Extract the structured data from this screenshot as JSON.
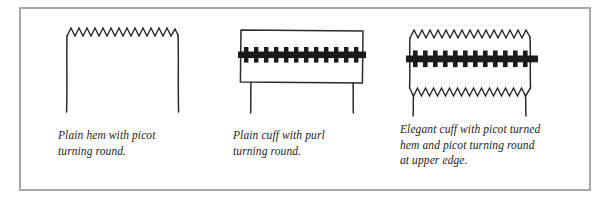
{
  "plate": {
    "border_color": "#a8a8a8",
    "background": "#ffffff",
    "ink_color": "#232323",
    "purl_color": "#1a1a1a"
  },
  "figures": [
    {
      "name": "plain-hem-with-picot",
      "caption": "Plain hem with picot\nturning round.",
      "features": {
        "top_edge": "picot-zigzag",
        "zigzag_peaks": 14,
        "side_legs": 2,
        "purl_band": false,
        "bottom_edge": "open"
      }
    },
    {
      "name": "plain-cuff-with-purl",
      "caption": "Plain cuff with purl\nturning round.",
      "features": {
        "top_edge": "straight",
        "zigzag_peaks": 0,
        "side_legs": 2,
        "purl_band": true,
        "purl_rungs": 13,
        "bottom_edge": "straight"
      }
    },
    {
      "name": "elegant-cuff-with-picot",
      "caption": "Elegant cuff with picot turned\nhem and picot turning round\nat upper edge.",
      "features": {
        "top_edge": "picot-zigzag",
        "zigzag_peaks": 13,
        "side_legs": 2,
        "purl_band": true,
        "purl_rungs": 13,
        "bottom_edge": "picot-zigzag"
      }
    }
  ]
}
